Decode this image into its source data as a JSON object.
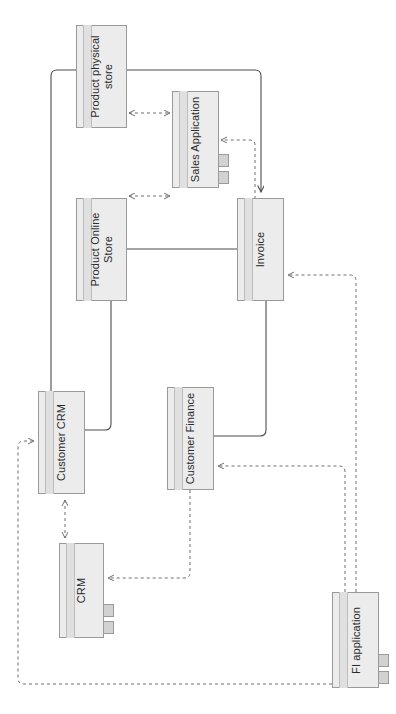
{
  "diagram": {
    "orientation": "rotated-90",
    "style": {
      "box_fill": "#ececec",
      "box_stroke": "#9a9a9a",
      "band_fill": "#e0e0e0",
      "leg_fill": "#d2d2d2",
      "solid_line": "#4d4d4d",
      "dotted_line": "#9a9a9a",
      "text": "#2b2b2b"
    },
    "nodes": [
      {
        "id": "product-physical-store",
        "label": "Product physical\nstore",
        "kind": "entity",
        "x": 76,
        "y": 25,
        "w": 51,
        "h": 103,
        "legs": 0
      },
      {
        "id": "sales-application",
        "label": "Sales Application",
        "kind": "application",
        "x": 172,
        "y": 91,
        "w": 47,
        "h": 97,
        "legs": 2
      },
      {
        "id": "product-online-store",
        "label": "Product Online\nStore",
        "kind": "entity",
        "x": 76,
        "y": 198,
        "w": 51,
        "h": 103,
        "legs": 0
      },
      {
        "id": "invoice",
        "label": "Invoice",
        "kind": "entity",
        "x": 237,
        "y": 198,
        "w": 47,
        "h": 103,
        "legs": 0
      },
      {
        "id": "customer-crm",
        "label": "Customer CRM",
        "kind": "entity",
        "x": 38,
        "y": 391,
        "w": 47,
        "h": 103,
        "legs": 0
      },
      {
        "id": "customer-finance",
        "label": "Customer Finance",
        "kind": "entity",
        "x": 167,
        "y": 387,
        "w": 47,
        "h": 103,
        "legs": 0
      },
      {
        "id": "crm",
        "label": "CRM",
        "kind": "application",
        "x": 59,
        "y": 543,
        "w": 45,
        "h": 95,
        "legs": 2
      },
      {
        "id": "fi-application",
        "label": "FI application",
        "kind": "application",
        "x": 332,
        "y": 592,
        "w": 47,
        "h": 96,
        "legs": 2
      }
    ],
    "edges": [
      {
        "id": "physical-store-to-sales-application",
        "from": "product-physical-store",
        "to": "sales-application",
        "style": "dashed",
        "arrows": "both"
      },
      {
        "id": "online-store-to-sales-application",
        "from": "product-online-store",
        "to": "sales-application",
        "style": "dashed",
        "arrows": "both"
      },
      {
        "id": "physical-store-to-invoice",
        "from": "product-physical-store",
        "to": "invoice",
        "style": "solid",
        "arrows": "to"
      },
      {
        "id": "online-store-to-invoice",
        "from": "product-online-store",
        "to": "invoice",
        "style": "solid",
        "arrows": "none"
      },
      {
        "id": "sales-application-from-invoice",
        "from": "invoice",
        "to": "sales-application",
        "style": "dashed",
        "arrows": "to"
      },
      {
        "id": "physical-store-to-customer-crm",
        "from": "product-physical-store",
        "to": "customer-crm",
        "style": "solid",
        "arrows": "none"
      },
      {
        "id": "online-store-to-customer-crm",
        "from": "product-online-store",
        "to": "customer-crm",
        "style": "solid",
        "arrows": "none"
      },
      {
        "id": "invoice-to-customer-finance",
        "from": "invoice",
        "to": "customer-finance",
        "style": "solid",
        "arrows": "none"
      },
      {
        "id": "customer-crm-to-crm",
        "from": "customer-crm",
        "to": "crm",
        "style": "dashed",
        "arrows": "both"
      },
      {
        "id": "customer-finance-to-crm",
        "from": "customer-finance",
        "to": "crm",
        "style": "dashed",
        "arrows": "to"
      },
      {
        "id": "fi-application-to-customer-finance",
        "from": "fi-application",
        "to": "customer-finance",
        "style": "dashed",
        "arrows": "to"
      },
      {
        "id": "fi-application-to-invoice",
        "from": "fi-application",
        "to": "invoice",
        "style": "dashed",
        "arrows": "to"
      },
      {
        "id": "fi-application-to-customer-crm",
        "from": "fi-application",
        "to": "customer-crm",
        "style": "dashed",
        "arrows": "to"
      }
    ]
  }
}
